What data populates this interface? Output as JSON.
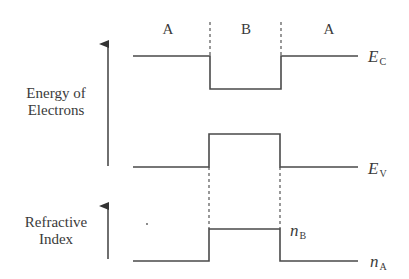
{
  "regions": [
    {
      "label": "A"
    },
    {
      "label": "B"
    },
    {
      "label": "A"
    }
  ],
  "axes": {
    "energy": {
      "line1": "Energy of",
      "line2": "Electrons"
    },
    "refractive": {
      "line1": "Refractive",
      "line2": "Index"
    }
  },
  "levels": {
    "conduction": {
      "symbol": "E",
      "subscript": "C"
    },
    "valence": {
      "symbol": "E",
      "subscript": "V"
    },
    "n_high": {
      "symbol": "n",
      "subscript": "B"
    },
    "n_low": {
      "symbol": "n",
      "subscript": "A"
    }
  },
  "colors": {
    "line": "#4a4a4a",
    "text": "#3a3a3a"
  }
}
